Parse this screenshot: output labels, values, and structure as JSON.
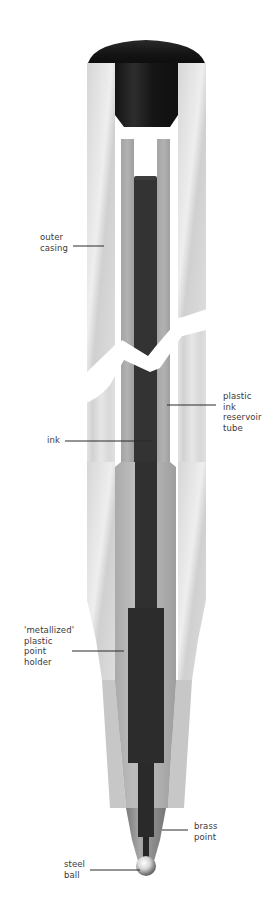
{
  "diagram": {
    "labels": {
      "outer_casing": [
        "outer",
        "casing"
      ],
      "plastic_ink_reservoir_tube": [
        "plastic",
        "ink",
        "reservoir",
        "tube"
      ],
      "ink": [
        "ink"
      ],
      "metallized_plastic_point_holder": [
        "'metallized'",
        "plastic",
        "point",
        "holder"
      ],
      "brass_point": [
        "brass",
        "point"
      ],
      "steel_ball": [
        "steel",
        "ball"
      ]
    },
    "colors": {
      "cap": "#1c1c1c",
      "casing": "#dcdcdc",
      "tube": "#a9a9a9",
      "ink": "#333333",
      "holder": "#b5b5b5",
      "brass": "#8e8e8e",
      "background": "#ffffff"
    }
  }
}
